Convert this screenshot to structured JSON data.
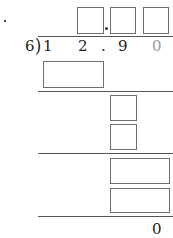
{
  "problem": {
    "type": "long-division",
    "divisor": "6",
    "dividend": {
      "digits": [
        "1",
        "2",
        ".",
        "9",
        "0"
      ],
      "appended_zero_gray": true
    },
    "quotient": {
      "blanks": 3,
      "has_decimal_point": true
    },
    "steps": [
      {
        "kind": "blank-wide"
      },
      {
        "kind": "blank-small"
      },
      {
        "kind": "blank-small"
      },
      {
        "kind": "blank-wide"
      },
      {
        "kind": "blank-wide"
      }
    ],
    "final_remainder": "0"
  },
  "colors": {
    "box_border": "#6f6f6f",
    "line": "#555555",
    "gray_digit": "#9a9a9a"
  }
}
